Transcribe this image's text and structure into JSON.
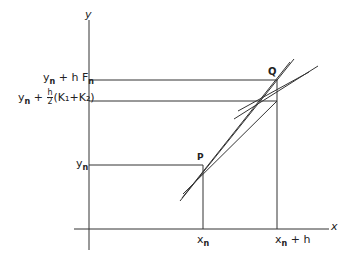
{
  "diagram": {
    "axes": {
      "x_label": "x",
      "y_label": "y"
    },
    "points": [
      {
        "name": "P",
        "label": "P"
      },
      {
        "name": "Q",
        "label": "Q"
      }
    ],
    "x_ticks": [
      {
        "base": "x",
        "sub": "n",
        "suffix": ""
      },
      {
        "base": "x",
        "sub": "n",
        "suffix": " + h"
      }
    ],
    "y_ticks": [
      {
        "base": "y",
        "sub": "n",
        "suffix": ""
      },
      {
        "base": "y",
        "sub": "n",
        "prefix_op": " + ",
        "frac_num": "h",
        "frac_den": "2",
        "tail": "(K₁+K₂)"
      },
      {
        "base": "y",
        "sub": "n",
        "suffix": " + h F",
        "suffix_sub": "n"
      }
    ]
  }
}
